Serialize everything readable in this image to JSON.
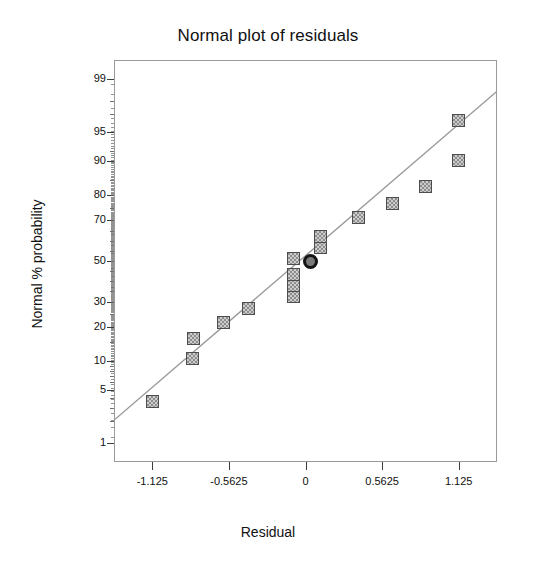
{
  "figure": {
    "title": "Normal plot of residuals",
    "background_color": "#ffffff",
    "frame_color": "#9a9a9a"
  },
  "axes": {
    "x_title": "Residual",
    "y_title": "Normal % probability"
  },
  "chart_data": {
    "type": "scatter",
    "title": "Normal plot of residuals",
    "xlabel": "Residual",
    "ylabel": "Normal % probability",
    "xlim": [
      -1.40625,
      1.40625
    ],
    "ylim_probability": [
      0.5,
      99.5
    ],
    "grid": false,
    "legend": null,
    "x_ticks": [
      -1.125,
      -0.5625,
      0,
      0.5625,
      1.125
    ],
    "x_tick_labels": [
      "-1.125",
      "-0.5625",
      "0",
      "0.5625",
      "1.125"
    ],
    "y_ticks": [
      1,
      5,
      10,
      20,
      30,
      50,
      70,
      80,
      90,
      95,
      99
    ],
    "y_tick_labels": [
      "1",
      "5",
      "10",
      "20",
      "30",
      "50",
      "70",
      "80",
      "90",
      "95",
      "99"
    ],
    "y_minor_ticks": [
      2,
      3,
      4,
      6,
      7,
      8,
      9,
      15,
      25,
      35,
      40,
      45,
      55,
      60,
      65,
      75,
      85,
      92,
      97,
      98
    ],
    "marker_style": "square",
    "marker_fill": "#8d8d8d",
    "marker_edge": "#4d4d4d",
    "highlight_marker_style": "circle",
    "highlight_marker_edge": "#141414",
    "highlight_marker_fill": "#7a7a7a",
    "reference_line": {
      "label": "normal reference line",
      "color": "#9a9a9a",
      "style": "solid",
      "x_start": -1.406,
      "y_start_probability": 2.2,
      "x_end": 1.406,
      "y_end_probability": 98.6
    },
    "series": [
      {
        "name": "Residuals",
        "points": [
          {
            "x": -1.125,
            "probability": 3.6,
            "highlight": false
          },
          {
            "x": -0.83,
            "probability": 10.7,
            "highlight": false
          },
          {
            "x": -0.82,
            "probability": 16.0,
            "highlight": false
          },
          {
            "x": -0.6,
            "probability": 21.5,
            "highlight": false
          },
          {
            "x": -0.42,
            "probability": 27.0,
            "highlight": false
          },
          {
            "x": -0.09,
            "probability": 32.3,
            "highlight": false
          },
          {
            "x": -0.09,
            "probability": 37.7,
            "highlight": false
          },
          {
            "x": -0.09,
            "probability": 43.0,
            "highlight": false
          },
          {
            "x": -0.09,
            "probability": 51.5,
            "highlight": false
          },
          {
            "x": 0.035,
            "probability": 50.0,
            "highlight": true
          },
          {
            "x": 0.11,
            "probability": 57.0,
            "highlight": false
          },
          {
            "x": 0.11,
            "probability": 62.5,
            "highlight": false
          },
          {
            "x": 0.39,
            "probability": 71.0,
            "highlight": false
          },
          {
            "x": 0.64,
            "probability": 77.0,
            "highlight": false
          },
          {
            "x": 0.88,
            "probability": 83.0,
            "highlight": false
          },
          {
            "x": 1.125,
            "probability": 90.0,
            "highlight": false
          },
          {
            "x": 1.125,
            "probability": 96.4,
            "highlight": false
          }
        ]
      }
    ]
  },
  "layout": {
    "plot_left": 114,
    "plot_top": 60,
    "plot_width": 383,
    "plot_height": 402
  }
}
